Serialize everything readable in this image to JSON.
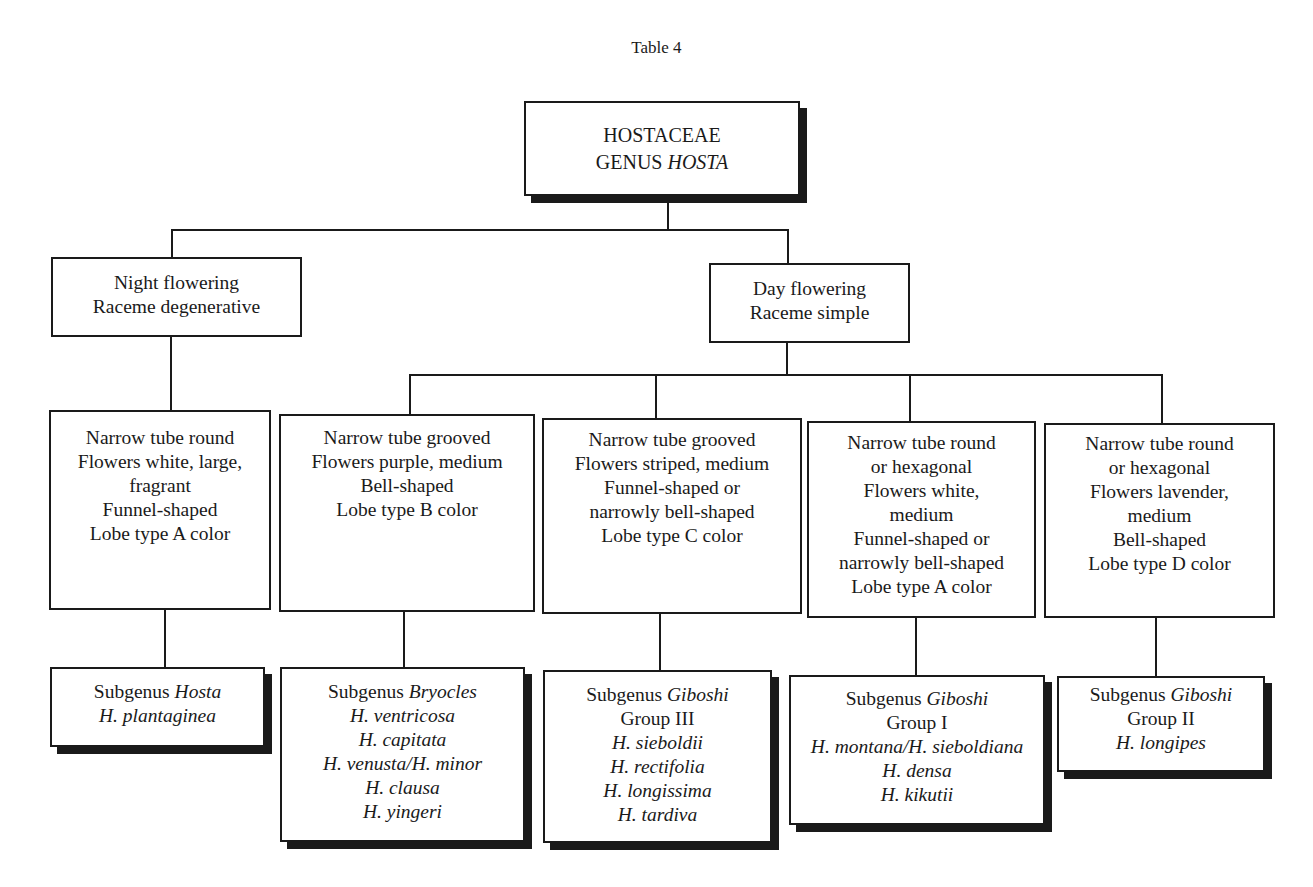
{
  "title": "Table 4",
  "root": {
    "line1": "HOSTACEAE",
    "line2_prefix": "GENUS ",
    "line2_italic": "HOSTA"
  },
  "level2": [
    {
      "id": "night",
      "lines": [
        "Night flowering",
        "Raceme degenerative"
      ]
    },
    {
      "id": "day",
      "lines": [
        "Day flowering",
        "Raceme simple"
      ]
    }
  ],
  "level3": [
    {
      "lines": [
        "Narrow tube round",
        "Flowers white, large,",
        "fragrant",
        "Funnel-shaped",
        "Lobe type A color"
      ]
    },
    {
      "lines": [
        "Narrow tube grooved",
        "Flowers purple, medium",
        "Bell-shaped",
        "Lobe type B color"
      ]
    },
    {
      "lines": [
        "Narrow tube grooved",
        "Flowers striped, medium",
        "Funnel-shaped or",
        "narrowly bell-shaped",
        "Lobe type C color"
      ]
    },
    {
      "lines": [
        "Narrow tube round",
        "or hexagonal",
        "Flowers white,",
        "medium",
        "Funnel-shaped or",
        "narrowly bell-shaped",
        "Lobe type A color"
      ]
    },
    {
      "lines": [
        "Narrow tube round",
        "or hexagonal",
        "Flowers lavender,",
        "medium",
        "Bell-shaped",
        "Lobe type D color"
      ]
    }
  ],
  "level4": [
    {
      "subgenus_prefix": "Subgenus ",
      "subgenus_name": "Hosta",
      "group": "",
      "species": [
        "H. plantaginea"
      ]
    },
    {
      "subgenus_prefix": "Subgenus ",
      "subgenus_name": "Bryocles",
      "group": "",
      "species": [
        "H. ventricosa",
        "H. capitata",
        "H. venusta/H. minor",
        "H. clausa",
        "H. yingeri"
      ]
    },
    {
      "subgenus_prefix": "Subgenus ",
      "subgenus_name": "Giboshi",
      "group": "Group III",
      "species": [
        "H. sieboldii",
        "H. rectifolia",
        "H. longissima",
        "H. tardiva"
      ]
    },
    {
      "subgenus_prefix": "Subgenus ",
      "subgenus_name": "Giboshi",
      "group": "Group I",
      "species": [
        "H. montana/H. sieboldiana",
        "H. densa",
        "H. kikutii"
      ]
    },
    {
      "subgenus_prefix": "Subgenus ",
      "subgenus_name": "Giboshi",
      "group": "Group II",
      "species": [
        "H. longipes"
      ]
    }
  ]
}
